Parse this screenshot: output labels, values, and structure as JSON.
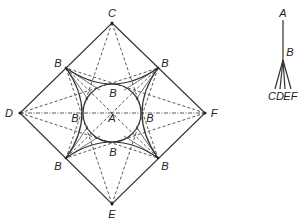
{
  "diagram": {
    "left_figure": {
      "outer_vertices": {
        "top": "C",
        "bottom": "E",
        "left": "D",
        "right": "F"
      },
      "center_label": "A",
      "mid_labels": [
        "B",
        "B",
        "B",
        "B",
        "B",
        "B",
        "B",
        "B"
      ],
      "labels": {
        "C": "C",
        "E": "E",
        "D": "D",
        "F": "F",
        "A": "A",
        "B_ul": "B",
        "B_ur": "B",
        "B_ll": "B",
        "B_lr": "B",
        "B_top": "B",
        "B_bottom": "B",
        "B_left": "B",
        "B_right": "B"
      }
    },
    "right_figure": {
      "labels": {
        "A": "A",
        "B": "B",
        "C": "C",
        "D": "D",
        "E": "E",
        "F": "F"
      }
    }
  }
}
